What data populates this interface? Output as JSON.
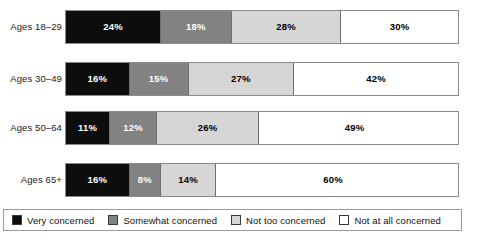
{
  "chart_data": {
    "type": "bar",
    "subtype": "stacked-horizontal-100",
    "title": "",
    "xlabel": "",
    "ylabel": "",
    "grid": false,
    "legend_position": "bottom",
    "xlim": [
      0,
      100
    ],
    "categories": [
      "Ages 18–29",
      "Ages 30–49",
      "Ages 50–64",
      "Ages 65+"
    ],
    "series": [
      {
        "name": "Very concerned",
        "color": "#0d0d0d",
        "values": [
          24,
          16,
          11,
          16
        ]
      },
      {
        "name": "Somewhat concerned",
        "color": "#828282",
        "values": [
          18,
          15,
          12,
          8
        ]
      },
      {
        "name": "Not too concerned",
        "color": "#d6d6d6",
        "values": [
          28,
          27,
          26,
          14
        ]
      },
      {
        "name": "Not at all concerned",
        "color": "#ffffff",
        "values": [
          30,
          42,
          49,
          60
        ]
      }
    ],
    "rows": [
      {
        "label": "Ages 18–29",
        "segments": [
          {
            "label": "24%",
            "value": 24,
            "series": "Very concerned"
          },
          {
            "label": "18%",
            "value": 18,
            "series": "Somewhat concerned"
          },
          {
            "label": "28%",
            "value": 28,
            "series": "Not too concerned"
          },
          {
            "label": "30%",
            "value": 30,
            "series": "Not at all concerned"
          }
        ]
      },
      {
        "label": "Ages 30–49",
        "segments": [
          {
            "label": "16%",
            "value": 16,
            "series": "Very concerned"
          },
          {
            "label": "15%",
            "value": 15,
            "series": "Somewhat concerned"
          },
          {
            "label": "27%",
            "value": 27,
            "series": "Not too concerned"
          },
          {
            "label": "42%",
            "value": 42,
            "series": "Not at all concerned"
          }
        ]
      },
      {
        "label": "Ages 50–64",
        "segments": [
          {
            "label": "11%",
            "value": 11,
            "series": "Very concerned"
          },
          {
            "label": "12%",
            "value": 12,
            "series": "Somewhat concerned"
          },
          {
            "label": "26%",
            "value": 26,
            "series": "Not too concerned"
          },
          {
            "label": "49%",
            "value": 49,
            "series": "Not at all concerned"
          }
        ]
      },
      {
        "label": "Ages 65+",
        "segments": [
          {
            "label": "16%",
            "value": 16,
            "series": "Very concerned"
          },
          {
            "label": "8%",
            "value": 8,
            "series": "Somewhat concerned"
          },
          {
            "label": "14%",
            "value": 14,
            "series": "Not too concerned"
          },
          {
            "label": "60%",
            "value": 60,
            "series": "Not at all concerned"
          }
        ]
      }
    ],
    "legend": [
      {
        "label": "Very concerned",
        "color": "#0d0d0d"
      },
      {
        "label": "Somewhat concerned",
        "color": "#828282"
      },
      {
        "label": "Not too concerned",
        "color": "#d6d6d6"
      },
      {
        "label": "Not at all concerned",
        "color": "#ffffff"
      }
    ]
  }
}
